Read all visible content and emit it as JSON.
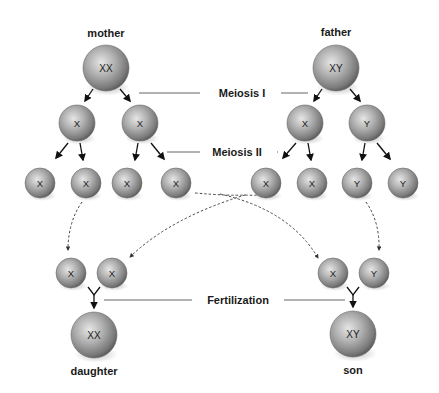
{
  "title_labels": {
    "mother": "mother",
    "father": "father",
    "daughter": "daughter",
    "son": "son"
  },
  "stage_labels": {
    "meiosis1": "Meiosis I",
    "meiosis2": "Meiosis II",
    "fertilization": "Fertilization"
  },
  "colors": {
    "cell_light": "#e4e4e4",
    "cell_mid": "#a8a8a8",
    "cell_dark": "#5e5e5e",
    "line": "#555555",
    "arrow": "#111111"
  },
  "cells": [
    {
      "id": "mother",
      "label": "XX",
      "cx": 106,
      "cy": 68,
      "r": 23
    },
    {
      "id": "father",
      "label": "XY",
      "cx": 336,
      "cy": 68,
      "r": 23
    },
    {
      "id": "m-m1-a",
      "label": "X",
      "cx": 77,
      "cy": 123,
      "r": 18
    },
    {
      "id": "m-m1-b",
      "label": "X",
      "cx": 140,
      "cy": 123,
      "r": 18
    },
    {
      "id": "f-m1-a",
      "label": "X",
      "cx": 305,
      "cy": 123,
      "r": 18
    },
    {
      "id": "f-m1-b",
      "label": "Y",
      "cx": 367,
      "cy": 123,
      "r": 18
    },
    {
      "id": "m-g1",
      "label": "X",
      "cx": 40,
      "cy": 183,
      "r": 15
    },
    {
      "id": "m-g2",
      "label": "X",
      "cx": 86,
      "cy": 183,
      "r": 15
    },
    {
      "id": "m-g3",
      "label": "X",
      "cx": 127,
      "cy": 183,
      "r": 15
    },
    {
      "id": "m-g4",
      "label": "X",
      "cx": 176,
      "cy": 183,
      "r": 15
    },
    {
      "id": "f-g1",
      "label": "X",
      "cx": 266,
      "cy": 183,
      "r": 15
    },
    {
      "id": "f-g2",
      "label": "X",
      "cx": 312,
      "cy": 183,
      "r": 15
    },
    {
      "id": "f-g3",
      "label": "Y",
      "cx": 357,
      "cy": 183,
      "r": 15
    },
    {
      "id": "f-g4",
      "label": "Y",
      "cx": 403,
      "cy": 183,
      "r": 15
    },
    {
      "id": "d-egg",
      "label": "X",
      "cx": 71,
      "cy": 273,
      "r": 15
    },
    {
      "id": "d-sperm",
      "label": "X",
      "cx": 112,
      "cy": 273,
      "r": 15
    },
    {
      "id": "s-egg",
      "label": "X",
      "cx": 333,
      "cy": 273,
      "r": 15
    },
    {
      "id": "s-sperm",
      "label": "Y",
      "cx": 374,
      "cy": 273,
      "r": 15
    },
    {
      "id": "daughter",
      "label": "XX",
      "cx": 94,
      "cy": 335,
      "r": 23
    },
    {
      "id": "son",
      "label": "XY",
      "cx": 353,
      "cy": 334,
      "r": 23
    }
  ]
}
